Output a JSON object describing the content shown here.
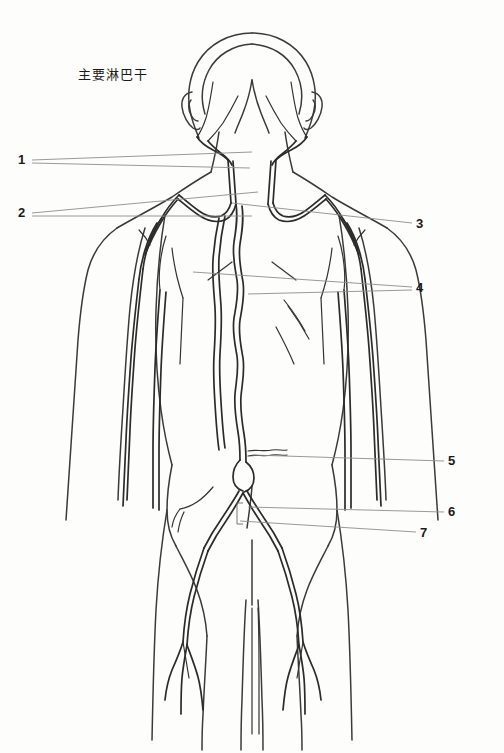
{
  "figure": {
    "title": "主要淋巴干",
    "title_translation": "Main lymphatic trunks",
    "view": "posterior view of human body",
    "background_color": "#fdfdfc",
    "line_color": "#2b2b2b",
    "leader_color": "#8d8d8d"
  },
  "callouts": [
    {
      "id": "1",
      "label": "1",
      "side": "left",
      "x": 18,
      "y": 153
    },
    {
      "id": "2",
      "label": "2",
      "side": "left",
      "x": 18,
      "y": 206
    },
    {
      "id": "3",
      "label": "3",
      "side": "right",
      "x": 416,
      "y": 217
    },
    {
      "id": "4",
      "label": "4",
      "side": "right",
      "x": 416,
      "y": 281
    },
    {
      "id": "5",
      "label": "5",
      "side": "right",
      "x": 448,
      "y": 454
    },
    {
      "id": "6",
      "label": "6",
      "side": "right",
      "x": 448,
      "y": 505
    },
    {
      "id": "7",
      "label": "7",
      "side": "right",
      "x": 420,
      "y": 526
    }
  ],
  "leader_lines": [
    {
      "for": "1",
      "points": "32,160 252,152"
    },
    {
      "for": "1b",
      "points": "32,163 250,168"
    },
    {
      "for": "2",
      "points": "32,213 258,192"
    },
    {
      "for": "2b",
      "points": "32,216 252,216"
    },
    {
      "for": "3",
      "points": "412,223 232,203"
    },
    {
      "for": "4",
      "points": "412,287 193,272"
    },
    {
      "for": "4b",
      "points": "412,290 248,294"
    },
    {
      "for": "5",
      "points": "444,461 252,455"
    },
    {
      "for": "6",
      "points": "444,512 248,507"
    },
    {
      "for": "7",
      "points": "416,532 240,521"
    }
  ]
}
